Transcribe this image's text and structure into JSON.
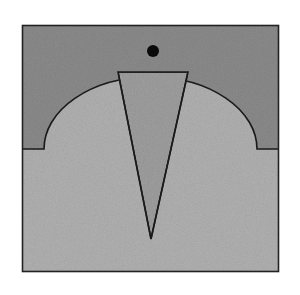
{
  "canvas": {
    "width": 300,
    "height": 295,
    "background": "#ffffff"
  },
  "frame": {
    "x": 22.5,
    "y": 25.5,
    "width": 256,
    "height": 246,
    "stroke": "#222222",
    "stroke_width": 1.6
  },
  "regions": {
    "upper_fill": "#8f8f8f",
    "lower_fill": "#b6b6b6",
    "wedge_fill": "#a3a3a3",
    "outline": "#1a1a1a"
  },
  "boundary": {
    "left_ledge_y": 149,
    "left_ledge_x_start": 22.5,
    "arc_start_x": 44,
    "arc_end_x": 257,
    "right_ledge_x_end": 278.5,
    "arc_rx": 106.5,
    "arc_ry": 72
  },
  "wedge": {
    "top_left": [
      118,
      72
    ],
    "top_right": [
      188,
      72
    ],
    "apex": [
      151,
      239
    ]
  },
  "dot": {
    "cx": 153,
    "cy": 51,
    "r": 6,
    "fill": "#0a0a0a"
  }
}
